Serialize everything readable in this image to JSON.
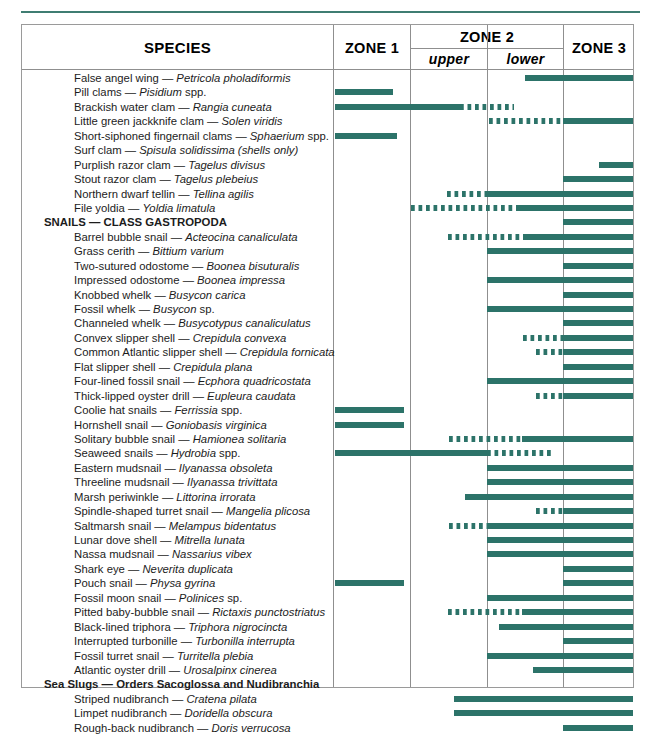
{
  "table": {
    "headers": {
      "species": "SPECIES",
      "zone1": "ZONE 1",
      "zone2": "ZONE 2",
      "zone2_upper": "upper",
      "zone2_lower": "lower",
      "zone3": "ZONE 3"
    },
    "colors": {
      "bar": "#2c7369",
      "rule": "#3f7d72",
      "grid": "#8f8f8f"
    },
    "column_bounds": {
      "species_start": 0,
      "zone1_start": 311,
      "zone2_upper_start": 388,
      "zone2_lower_start": 465,
      "zone3_start": 541,
      "zone3_end": 611
    },
    "rows": [
      {
        "common": "False angel wing",
        "sci": "Petricola pholadiformis",
        "sci_suffix": "",
        "group": false,
        "bars": [
          {
            "style": "solid",
            "start": 503,
            "end": 611
          }
        ]
      },
      {
        "common": "Pill clams",
        "sci": "Pisidium",
        "sci_suffix": " spp.",
        "group": false,
        "bars": [
          {
            "style": "solid",
            "start": 313,
            "end": 371
          }
        ]
      },
      {
        "common": "Brackish water clam",
        "sci": "Rangia cuneata",
        "sci_suffix": "",
        "group": false,
        "bars": [
          {
            "style": "solid",
            "start": 313,
            "end": 438
          },
          {
            "style": "dashed",
            "start": 438,
            "end": 492
          }
        ]
      },
      {
        "common": "Little green jackknife clam",
        "sci": "Solen viridis",
        "sci_suffix": "",
        "group": false,
        "bars": [
          {
            "style": "dashed",
            "start": 467,
            "end": 541
          },
          {
            "style": "solid",
            "start": 541,
            "end": 611
          }
        ]
      },
      {
        "common": "Short-siphoned fingernail clams",
        "sci": "Sphaerium",
        "sci_suffix": " spp.",
        "group": false,
        "bars": [
          {
            "style": "solid",
            "start": 313,
            "end": 375
          }
        ]
      },
      {
        "common": "Surf clam",
        "sci": "Spisula solidissima (shells only)",
        "sci_suffix": "",
        "group": false,
        "bars": []
      },
      {
        "common": "Purplish razor clam",
        "sci": "Tagelus divisus",
        "sci_suffix": "",
        "group": false,
        "bars": [
          {
            "style": "solid",
            "start": 577,
            "end": 611
          }
        ]
      },
      {
        "common": "Stout razor clam",
        "sci": "Tagelus plebeius",
        "sci_suffix": "",
        "group": false,
        "bars": [
          {
            "style": "solid",
            "start": 541,
            "end": 611
          }
        ]
      },
      {
        "common": "Northern dwarf tellin",
        "sci": "Tellina agilis",
        "sci_suffix": "",
        "group": false,
        "bars": [
          {
            "style": "dashed",
            "start": 425,
            "end": 465
          },
          {
            "style": "solid",
            "start": 465,
            "end": 611
          }
        ]
      },
      {
        "common": "File yoldia",
        "sci": "Yoldia limatula",
        "sci_suffix": "",
        "group": false,
        "bars": [
          {
            "style": "dashed",
            "start": 389,
            "end": 494
          },
          {
            "style": "solid",
            "start": 494,
            "end": 611
          }
        ]
      },
      {
        "common": "SNAILS — CLASS GASTROPODA",
        "sci": "",
        "sci_suffix": "",
        "group": true,
        "bars": [
          {
            "style": "solid",
            "start": 541,
            "end": 611
          }
        ]
      },
      {
        "common": "Barrel bubble snail",
        "sci": "Acteocina canaliculata",
        "sci_suffix": "",
        "group": false,
        "bars": [
          {
            "style": "dashed",
            "start": 426,
            "end": 501
          },
          {
            "style": "solid",
            "start": 501,
            "end": 611
          }
        ]
      },
      {
        "common": "Grass cerith",
        "sci": "Bittium varium",
        "sci_suffix": "",
        "group": false,
        "bars": [
          {
            "style": "solid",
            "start": 465,
            "end": 611
          }
        ]
      },
      {
        "common": "Two-sutured odostome",
        "sci": "Boonea bisuturalis",
        "sci_suffix": "",
        "group": false,
        "bars": [
          {
            "style": "solid",
            "start": 541,
            "end": 611
          }
        ]
      },
      {
        "common": "Impressed odostome",
        "sci": "Boonea impressa",
        "sci_suffix": "",
        "group": false,
        "bars": [
          {
            "style": "solid",
            "start": 465,
            "end": 611
          }
        ]
      },
      {
        "common": "Knobbed whelk",
        "sci": "Busycon carica",
        "sci_suffix": "",
        "group": false,
        "bars": [
          {
            "style": "solid",
            "start": 541,
            "end": 611
          }
        ]
      },
      {
        "common": "Fossil whelk",
        "sci": "Busycon",
        "sci_suffix": " sp.",
        "group": false,
        "bars": [
          {
            "style": "solid",
            "start": 465,
            "end": 611
          }
        ]
      },
      {
        "common": "Channeled whelk",
        "sci": "Busycotypus canaliculatus",
        "sci_suffix": "",
        "group": false,
        "bars": [
          {
            "style": "solid",
            "start": 541,
            "end": 611
          }
        ]
      },
      {
        "common": "Convex slipper shell",
        "sci": "Crepidula convexa",
        "sci_suffix": "",
        "group": false,
        "bars": [
          {
            "style": "dashed",
            "start": 501,
            "end": 541
          },
          {
            "style": "solid",
            "start": 541,
            "end": 611
          }
        ]
      },
      {
        "common": "Common Atlantic slipper shell",
        "sci": "Crepidula fornicata",
        "sci_suffix": "",
        "group": false,
        "bars": [
          {
            "style": "dashed",
            "start": 514,
            "end": 541
          },
          {
            "style": "solid",
            "start": 541,
            "end": 611
          }
        ]
      },
      {
        "common": "Flat slipper shell",
        "sci": "Crepidula plana",
        "sci_suffix": "",
        "group": false,
        "bars": [
          {
            "style": "solid",
            "start": 541,
            "end": 611
          }
        ]
      },
      {
        "common": "Four-lined fossil snail",
        "sci": "Ecphora quadricostata",
        "sci_suffix": "",
        "group": false,
        "bars": [
          {
            "style": "solid",
            "start": 465,
            "end": 611
          }
        ]
      },
      {
        "common": "Thick-lipped oyster drill",
        "sci": "Eupleura caudata",
        "sci_suffix": "",
        "group": false,
        "bars": [
          {
            "style": "dashed",
            "start": 514,
            "end": 541
          },
          {
            "style": "solid",
            "start": 541,
            "end": 611
          }
        ]
      },
      {
        "common": "Coolie hat snails",
        "sci": "Ferrissia",
        "sci_suffix": " spp.",
        "group": false,
        "bars": [
          {
            "style": "solid",
            "start": 313,
            "end": 382
          }
        ]
      },
      {
        "common": "Hornshell snail",
        "sci": "Goniobasis virginica",
        "sci_suffix": "",
        "group": false,
        "bars": [
          {
            "style": "solid",
            "start": 313,
            "end": 382
          }
        ]
      },
      {
        "common": "Solitary bubble snail",
        "sci": "Hamionea solitaria",
        "sci_suffix": "",
        "group": false,
        "bars": [
          {
            "style": "dashed",
            "start": 427,
            "end": 500
          },
          {
            "style": "solid",
            "start": 500,
            "end": 611
          }
        ]
      },
      {
        "common": "Seaweed snails",
        "sci": "Hydrobia",
        "sci_suffix": " spp.",
        "group": false,
        "bars": [
          {
            "style": "solid",
            "start": 313,
            "end": 465
          },
          {
            "style": "dashed",
            "start": 465,
            "end": 530
          }
        ]
      },
      {
        "common": "Eastern mudsnail",
        "sci": "Ilyanassa obsoleta",
        "sci_suffix": "",
        "group": false,
        "bars": [
          {
            "style": "solid",
            "start": 465,
            "end": 611
          }
        ]
      },
      {
        "common": "Threeline mudsnail",
        "sci": "Ilyanassa trivittata",
        "sci_suffix": "",
        "group": false,
        "bars": [
          {
            "style": "solid",
            "start": 465,
            "end": 611
          }
        ]
      },
      {
        "common": "Marsh periwinkle",
        "sci": "Littorina irrorata",
        "sci_suffix": "",
        "group": false,
        "bars": [
          {
            "style": "solid",
            "start": 443,
            "end": 611
          }
        ]
      },
      {
        "common": "Spindle-shaped turret snail",
        "sci": "Mangelia plicosa",
        "sci_suffix": "",
        "group": false,
        "bars": [
          {
            "style": "dashed",
            "start": 514,
            "end": 541
          },
          {
            "style": "solid",
            "start": 541,
            "end": 611
          }
        ]
      },
      {
        "common": "Saltmarsh snail",
        "sci": "Melampus bidentatus",
        "sci_suffix": "",
        "group": false,
        "bars": [
          {
            "style": "dashed",
            "start": 427,
            "end": 465
          },
          {
            "style": "solid",
            "start": 465,
            "end": 611
          }
        ]
      },
      {
        "common": "Lunar dove shell",
        "sci": "Mitrella lunata",
        "sci_suffix": "",
        "group": false,
        "bars": [
          {
            "style": "solid",
            "start": 465,
            "end": 611
          }
        ]
      },
      {
        "common": "Nassa mudsnail",
        "sci": "Nassarius vibex",
        "sci_suffix": "",
        "group": false,
        "bars": [
          {
            "style": "solid",
            "start": 465,
            "end": 611
          }
        ]
      },
      {
        "common": "Shark eye",
        "sci": "Neverita duplicata",
        "sci_suffix": "",
        "group": false,
        "bars": [
          {
            "style": "solid",
            "start": 541,
            "end": 611
          }
        ]
      },
      {
        "common": "Pouch snail",
        "sci": "Physa gyrina",
        "sci_suffix": "",
        "group": false,
        "bars": [
          {
            "style": "solid",
            "start": 313,
            "end": 382
          },
          {
            "style": "solid",
            "start": 541,
            "end": 611
          }
        ]
      },
      {
        "common": "Fossil moon snail",
        "sci": "Polinices",
        "sci_suffix": " sp.",
        "group": false,
        "bars": [
          {
            "style": "solid",
            "start": 465,
            "end": 611
          }
        ]
      },
      {
        "common": "Pitted baby-bubble snail",
        "sci": "Rictaxis punctostriatus",
        "sci_suffix": "",
        "group": false,
        "bars": [
          {
            "style": "dashed",
            "start": 426,
            "end": 500
          },
          {
            "style": "solid",
            "start": 500,
            "end": 611
          }
        ]
      },
      {
        "common": "Black-lined triphora",
        "sci": "Triphora nigrocincta",
        "sci_suffix": "",
        "group": false,
        "bars": [
          {
            "style": "solid",
            "start": 477,
            "end": 611
          }
        ]
      },
      {
        "common": "Interrupted turbonille",
        "sci": "Turbonilla interrupta",
        "sci_suffix": "",
        "group": false,
        "bars": [
          {
            "style": "solid",
            "start": 541,
            "end": 611
          }
        ]
      },
      {
        "common": "Fossil turret snail",
        "sci": "Turritella plebia",
        "sci_suffix": "",
        "group": false,
        "bars": [
          {
            "style": "solid",
            "start": 465,
            "end": 611
          }
        ]
      },
      {
        "common": "Atlantic oyster drill",
        "sci": "Urosalpinx cinerea",
        "sci_suffix": "",
        "group": false,
        "bars": [
          {
            "style": "solid",
            "start": 511,
            "end": 611
          }
        ]
      },
      {
        "common": "Sea Slugs — Orders Sacoglossa and Nudibranchia",
        "sci": "",
        "sci_suffix": "",
        "group": true,
        "bars": []
      },
      {
        "common": "Striped nudibranch",
        "sci": "Cratena pilata",
        "sci_suffix": "",
        "group": false,
        "bars": [
          {
            "style": "solid",
            "start": 432,
            "end": 611
          }
        ]
      },
      {
        "common": "Limpet nudibranch",
        "sci": "Doridella obscura",
        "sci_suffix": "",
        "group": false,
        "bars": [
          {
            "style": "solid",
            "start": 432,
            "end": 611
          }
        ]
      },
      {
        "common": "Rough-back nudibranch",
        "sci": "Doris verrucosa",
        "sci_suffix": "",
        "group": false,
        "bars": [
          {
            "style": "solid",
            "start": 541,
            "end": 611
          }
        ]
      }
    ]
  }
}
